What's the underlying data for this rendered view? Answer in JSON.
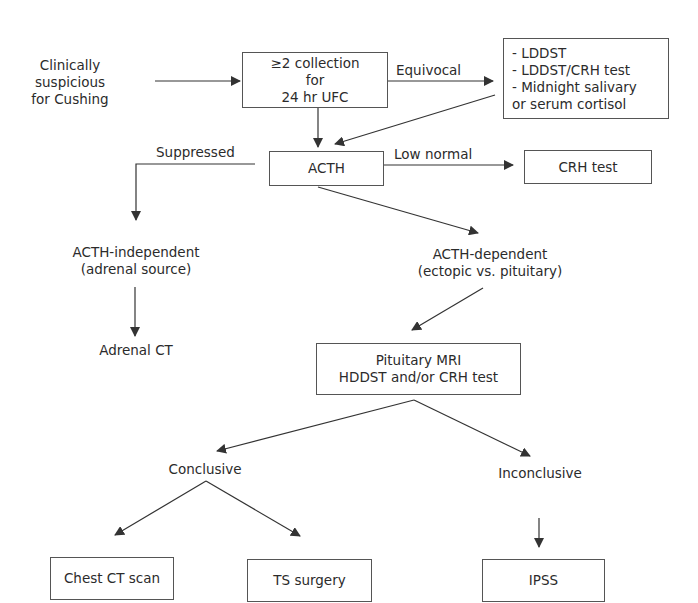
{
  "flowchart": {
    "start": {
      "lines": [
        "Clinically",
        "suspicious",
        "for Cushing"
      ]
    },
    "ufc_box": {
      "lines": [
        "≥2 collection",
        "for",
        "24 hr UFC"
      ]
    },
    "tests_box": {
      "lines": [
        "- LDDST",
        "- LDDST/CRH test",
        "- Midnight salivary",
        "or serum cortisol"
      ]
    },
    "acth_box": {
      "lines": [
        "ACTH"
      ]
    },
    "crh_box": {
      "lines": [
        "CRH test"
      ]
    },
    "acth_independent": {
      "lines": [
        "ACTH-independent",
        "(adrenal source)"
      ]
    },
    "adrenal_ct": {
      "lines": [
        "Adrenal CT"
      ]
    },
    "acth_dependent": {
      "lines": [
        "ACTH-dependent",
        "(ectopic vs. pituitary)"
      ]
    },
    "pituitary_box": {
      "lines": [
        "Pituitary MRI",
        "HDDST and/or CRH test"
      ]
    },
    "conclusive": {
      "lines": [
        "Conclusive"
      ]
    },
    "inconclusive": {
      "lines": [
        "Inconclusive"
      ]
    },
    "chest_ct_box": {
      "lines": [
        "Chest CT scan"
      ]
    },
    "ts_surgery_box": {
      "lines": [
        "TS surgery"
      ]
    },
    "ipss_box": {
      "lines": [
        "IPSS"
      ]
    },
    "edge_labels": {
      "equivocal": "Equivocal",
      "suppressed": "Suppressed",
      "low_normal": "Low normal"
    },
    "colors": {
      "line": "#333333",
      "text": "#2b2b2b",
      "border": "#555555",
      "background": "#ffffff"
    }
  }
}
